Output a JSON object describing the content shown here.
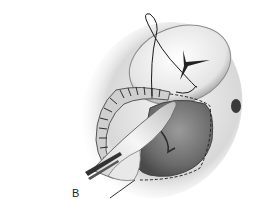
{
  "figure": {
    "panel_label": "B",
    "colors": {
      "background": "#ffffff",
      "tissue_light": "#e6e6e6",
      "tissue_mid": "#bdbdbd",
      "tissue_dark": "#6e6e6e",
      "suture": "#1a1a1a"
    }
  }
}
